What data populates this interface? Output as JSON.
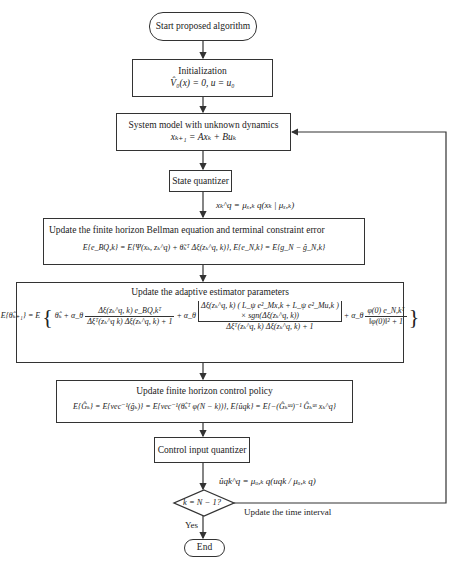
{
  "diagram": {
    "start": {
      "label": "Start proposed algorithm"
    },
    "init": {
      "title": "Initialization",
      "equation": "V̂₀(x) = 0, u = u₀"
    },
    "system": {
      "title": "System model with unknown dynamics",
      "equation": "xₖ₊₁ = Axₖ + Buₖ"
    },
    "state_quantizer": {
      "title": "State quantizer"
    },
    "state_quantizer_output": "xₖ^q = μₓ,ₖ q(xₖ | μₓ,ₖ)",
    "bellman": {
      "title": "Update the finite horizon Bellman equation and terminal constraint error",
      "equation": "E{e_BQ,k} = E{Ψ(xₖ, zₖ^q) + θ̃ₖᵀ Δξ(zₖ^q, k)}, E{e_N,k} = E{g_N − ĝ_N,k}"
    },
    "adaptive": {
      "title": "Update the adaptive estimator parameters",
      "lhs": "E{θ̂ₖ₊₁} = E",
      "term0": "θ̂ₖ + α_θ",
      "frac1_num": "Δξ(zₖ^q, k) e_BQ,kᵀ",
      "frac1_den": "Δξᵀ(zₖ^q k) Δξ(zₖ^q, k) + 1",
      "plus_alpha": "+ α_θ",
      "frac2_num_line1": "Δξ(zₖ^q, k) ( L_ψ e²_Mx,k + L_ψ e²_Mu,k )",
      "frac2_num_line2": "× sgn(Δξ(zₖ^q, k))",
      "frac2_den": "Δξᵀ(zₖ^q, k) Δξ(zₖ^q, k) + 1",
      "frac3_num": "φ(0) e_N,kᵀ",
      "frac3_den": "‖φ(0)‖² + 1"
    },
    "policy": {
      "title": "Update finite horizon control policy",
      "equation": "E{Ĝₖ} = E{vec⁻¹(ĝₖ)} = E{vec⁻¹(θ̂ₖᵀ φ(N − k))}, E{ûqk} = E{−(Ĝₖᵘᵘ)⁻¹ Ĝₖᵘˣ xₖ^q}"
    },
    "control_quantizer": {
      "title": "Control input quantizer"
    },
    "control_quantizer_output": "ûqk^q = μᵤ,ₖ q(uqk / μᵤ,ₖ q)",
    "decision": {
      "label": "k = N − 1?"
    },
    "loop_label": "Update the time interval",
    "yes_label": "Yes",
    "end": {
      "label": "End"
    }
  },
  "colors": {
    "stroke": "#333333",
    "background": "#ffffff",
    "text": "#222222"
  }
}
